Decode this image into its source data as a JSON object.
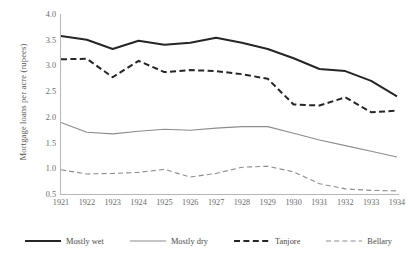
{
  "chart_data": {
    "type": "line",
    "title": "",
    "xlabel": "",
    "ylabel": "Mortgage loans per acre (rupees)",
    "categories": [
      "1921",
      "1922",
      "1923",
      "1924",
      "1925",
      "1926",
      "1927",
      "1928",
      "1929",
      "1930",
      "1931",
      "1932",
      "1933",
      "1934"
    ],
    "ylim": [
      0.5,
      4.0
    ],
    "ytick_step": 0.5,
    "yticks": [
      "0.5",
      "1.0",
      "1.5",
      "2.0",
      "2.5",
      "3.0",
      "3.5",
      "4.0"
    ],
    "grid": false,
    "legend_position": "bottom",
    "series": [
      {
        "name": "Mostly wet",
        "style": "solid",
        "color": "#262626",
        "width": 2.0,
        "values": [
          3.57,
          3.5,
          3.32,
          3.48,
          3.4,
          3.44,
          3.54,
          3.44,
          3.32,
          3.14,
          2.93,
          2.89,
          2.7,
          2.4
        ]
      },
      {
        "name": "Mostly dry",
        "style": "solid",
        "color": "#8c8c8c",
        "width": 1.1,
        "values": [
          1.89,
          1.7,
          1.67,
          1.72,
          1.76,
          1.74,
          1.78,
          1.81,
          1.81,
          1.68,
          1.55,
          1.44,
          1.33,
          1.22
        ]
      },
      {
        "name": "Tanjore",
        "style": "dashed",
        "color": "#262626",
        "width": 2.0,
        "values": [
          3.12,
          3.13,
          2.77,
          3.09,
          2.87,
          2.91,
          2.89,
          2.83,
          2.74,
          2.24,
          2.22,
          2.38,
          2.09,
          2.12
        ]
      },
      {
        "name": "Bellary",
        "style": "dashed",
        "color": "#8c8c8c",
        "width": 1.1,
        "values": [
          0.97,
          0.89,
          0.9,
          0.92,
          0.98,
          0.83,
          0.9,
          1.02,
          1.04,
          0.93,
          0.7,
          0.6,
          0.57,
          0.56
        ]
      }
    ]
  }
}
